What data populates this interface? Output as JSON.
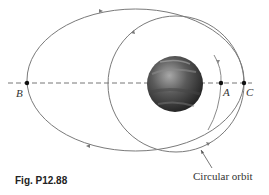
{
  "figure": {
    "caption": "Fig. P12.88",
    "points": [
      {
        "id": "B",
        "label": "B"
      },
      {
        "id": "A",
        "label": "A"
      },
      {
        "id": "C",
        "label": "C"
      }
    ],
    "annotation": "Circular orbit",
    "colors": {
      "orbit": "#7a7a7a",
      "dashed_axis": "#777777",
      "point": "#111111",
      "planet_dark": "#2e2e2e",
      "planet_light": "#9a9a9a"
    }
  }
}
